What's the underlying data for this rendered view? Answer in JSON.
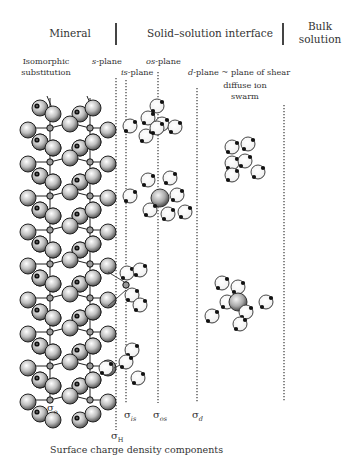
{
  "headers": {
    "mineral": "Mineral",
    "interface": "Solid–solution interface",
    "bulk_line1": "Bulk",
    "bulk_line2": "solution"
  },
  "labels": {
    "isomorphic_line1": "Isomorphic",
    "isomorphic_line2": "substitution",
    "s_plane_italic": "s",
    "s_plane_rest": "-plane",
    "is_plane_italic": "is",
    "is_plane_rest": "-plane",
    "os_plane_italic": "os",
    "os_plane_rest": "-plane",
    "d_plane_italic": "d",
    "d_plane_rest": "-plane ~ plane of shear",
    "diffuse_line1": "diffuse ion",
    "diffuse_line2": "swarm"
  },
  "sigma": {
    "symbol": "σ",
    "o": "o",
    "H": "H",
    "is": "is",
    "os": "os",
    "d": "d"
  },
  "caption": "Surface charge density components",
  "planes_x": {
    "s": 116,
    "is": 126,
    "os": 158,
    "d": 197,
    "bulk": 284
  },
  "colors": {
    "line": "#555555",
    "text": "#333333"
  }
}
